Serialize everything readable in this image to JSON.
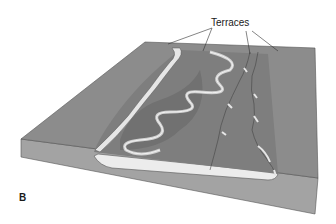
{
  "figure": {
    "callout_label": "Terraces",
    "panel_label": "B",
    "colors": {
      "surface": "#8c8c8c",
      "surface_dark": "#6e6e6e",
      "front_face": "#a3a3a3",
      "alluvium": "#ececec",
      "river": "#d0d0d0",
      "terrace_edge": "#e6e6e6",
      "outline": "#555555",
      "leader_line": "#333333"
    }
  }
}
